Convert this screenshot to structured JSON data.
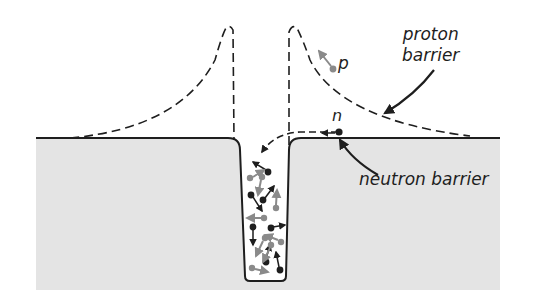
{
  "figure": {
    "title": "",
    "labels": {
      "proton_barrier_line1": "proton",
      "proton_barrier_line2": "barrier",
      "proton_particle": "p",
      "neutron_particle": "n",
      "neutron_barrier": "neutron barrier"
    },
    "colors": {
      "background": "#ffffff",
      "nucleus_region": "#e4e4e4",
      "ink": "#1e1e1e",
      "proton": "#8a8a8a",
      "neutron": "#1e1e1e"
    },
    "elements": [
      {
        "id": "potential-well",
        "description": "solid potential well (neutron barrier) cut into gray region"
      },
      {
        "id": "proton-barrier",
        "description": "dashed Coulomb barrier curve with two peaks"
      },
      {
        "id": "incoming-neutron-path",
        "description": "dashed arrow path of neutron entering well"
      },
      {
        "id": "outgoing-proton",
        "description": "gray proton with arrow moving away"
      },
      {
        "id": "nucleons",
        "description": "mixed gray (proton) and black (neutron) particles with arrows inside the well"
      }
    ]
  }
}
